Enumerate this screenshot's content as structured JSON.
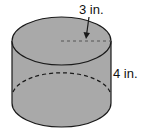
{
  "figure": {
    "shape": "cylinder",
    "fill_color": "#a9a9a9",
    "stroke_color": "#1a1a1a",
    "labels": {
      "radius": "3 in.",
      "height": "4 in."
    }
  }
}
